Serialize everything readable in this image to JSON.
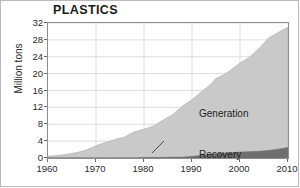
{
  "chart_data": {
    "type": "area",
    "title": "PLASTICS",
    "xlabel": "",
    "ylabel": "Million tons",
    "xlim": [
      1960,
      2010
    ],
    "ylim": [
      0,
      32
    ],
    "grid": true,
    "legend_position": "inline-annotations",
    "stacked": true,
    "xticks": [
      "1960",
      "1970",
      "1980",
      "1990",
      "2000",
      "2010"
    ],
    "yticks": [
      "0",
      "4",
      "8",
      "12",
      "16",
      "20",
      "24",
      "28",
      "32"
    ],
    "x": [
      1960,
      1962,
      1964,
      1966,
      1968,
      1970,
      1972,
      1974,
      1976,
      1978,
      1980,
      1982,
      1984,
      1986,
      1988,
      1990,
      1992,
      1994,
      1995,
      1996,
      1998,
      2000,
      2002,
      2004,
      2006,
      2008,
      2010
    ],
    "series": [
      {
        "name": "Generation",
        "color": "#c9c9c9",
        "values": [
          0.4,
          0.6,
          0.9,
          1.3,
          1.9,
          2.9,
          3.7,
          4.4,
          5.0,
          6.2,
          6.8,
          7.6,
          9.0,
          10.3,
          12.3,
          13.8,
          15.7,
          17.6,
          18.9,
          19.3,
          20.8,
          22.5,
          23.9,
          26.0,
          28.5,
          29.8,
          31.0
        ]
      },
      {
        "name": "Recovery",
        "color": "#6e6e6e",
        "values": [
          0.0,
          0.0,
          0.0,
          0.0,
          0.0,
          0.0,
          0.0,
          0.0,
          0.0,
          0.0,
          0.1,
          0.1,
          0.1,
          0.2,
          0.2,
          0.4,
          0.6,
          0.9,
          1.0,
          1.1,
          1.2,
          1.4,
          1.5,
          1.6,
          1.8,
          2.1,
          2.5
        ]
      }
    ]
  }
}
